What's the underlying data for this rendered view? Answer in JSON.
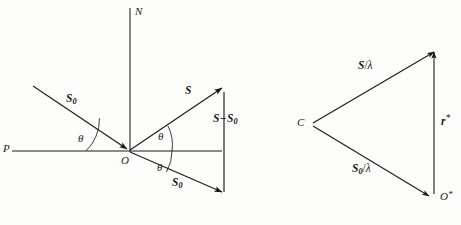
{
  "figure": {
    "background_color": "#fdfdfc",
    "line_color": "#1a1a1a",
    "left_diagram": {
      "name": "scattering-vector-diagram",
      "origin_label": "O",
      "normal_label": "N",
      "plane_label": "P",
      "incident_label_main": "S",
      "incident_label_sub": "0",
      "scattered_label": "S",
      "difference_label_first": "S",
      "difference_label_minus": "−",
      "difference_label_second": "S",
      "difference_label_sub": "0",
      "transmitted_label_main": "S",
      "transmitted_label_sub": "0",
      "angle_label_incident": "θ",
      "angle_label_scattered": "θ",
      "angle_label_transmitted": "θ"
    },
    "right_diagram": {
      "name": "ewald-triangle-diagram",
      "center_label": "C",
      "origin_star_label": "O",
      "origin_star_mark": "*",
      "scattered_over_lambda_num": "S",
      "scattered_over_lambda_slash": "/",
      "scattered_over_lambda_den": "λ",
      "incident_over_lambda_num": "S",
      "incident_over_lambda_sub": "0",
      "incident_over_lambda_slash": "/",
      "incident_over_lambda_den": "λ",
      "reciprocal_vector_label": "r",
      "reciprocal_vector_star": "*"
    }
  }
}
